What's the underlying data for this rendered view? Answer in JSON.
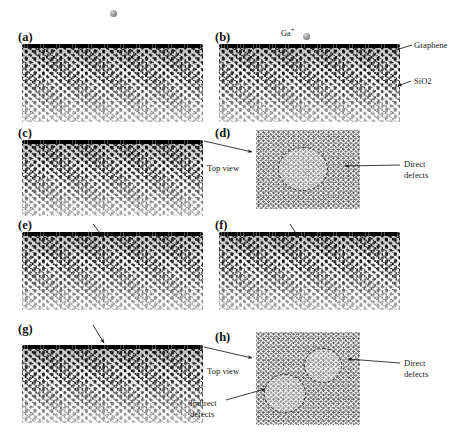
{
  "figure": {
    "type": "molecular-dynamics-simulation-panels",
    "panels": [
      {
        "id": "a",
        "label": "(a)",
        "view": "cross-section",
        "x": 18,
        "y": 30,
        "box_x": 22,
        "box_y": 44,
        "box_w": 181,
        "box_h": 78
      },
      {
        "id": "b",
        "label": "(b)",
        "view": "cross-section",
        "x": 215,
        "y": 30,
        "box_x": 219,
        "box_y": 44,
        "box_w": 181,
        "box_h": 78
      },
      {
        "id": "c",
        "label": "(c)",
        "view": "cross-section",
        "x": 18,
        "y": 126,
        "box_x": 22,
        "box_y": 140,
        "box_w": 181,
        "box_h": 76
      },
      {
        "id": "d",
        "label": "(d)",
        "view": "top-view",
        "x": 215,
        "y": 126,
        "box_x": 256,
        "box_y": 130,
        "box_w": 104,
        "box_h": 79
      },
      {
        "id": "e",
        "label": "(e)",
        "view": "cross-section",
        "x": 18,
        "y": 218,
        "box_x": 22,
        "box_y": 232,
        "box_w": 181,
        "box_h": 78
      },
      {
        "id": "f",
        "label": "(f)",
        "view": "cross-section",
        "x": 215,
        "y": 218,
        "box_x": 219,
        "box_y": 232,
        "box_w": 181,
        "box_h": 78
      },
      {
        "id": "g",
        "label": "(g)",
        "view": "cross-section",
        "x": 18,
        "y": 322,
        "box_x": 22,
        "box_y": 345,
        "box_w": 181,
        "box_h": 78
      },
      {
        "id": "h",
        "label": "(h)",
        "view": "top-view",
        "x": 215,
        "y": 330,
        "box_x": 256,
        "box_y": 332,
        "box_w": 104,
        "box_h": 93
      }
    ],
    "annotations": {
      "ion_species": "Ga",
      "ion_charge": "+",
      "graphene_label": "Graphene",
      "substrate_label": "SiO2",
      "top_view_label_d": "Top view",
      "top_view_label_h": "Top view",
      "direct_defects_label_d": "Direct\ndefects",
      "direct_defects_label_h": "Direct\ndefects",
      "indirect_defects_label_h": "Indirect\ndefects"
    },
    "colors": {
      "graphene": "#000000",
      "substrate": "#1a1a1a",
      "ion_sphere": "#8f8f8f",
      "annotation_text": "#1a1a1a",
      "defect_circle": "#333333",
      "background": "#ffffff"
    }
  }
}
